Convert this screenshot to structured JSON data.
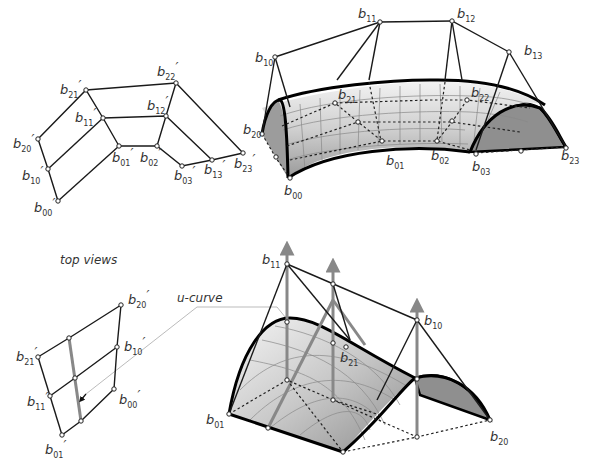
{
  "figure": {
    "caption_top_views": "top views",
    "caption_u_curve": "u-curve"
  },
  "top_left_view": {
    "labels": [
      {
        "base": "b",
        "sub": "21",
        "prime": "′"
      },
      {
        "base": "b",
        "sub": "22",
        "prime": "′"
      },
      {
        "base": "b",
        "sub": "11",
        "prime": "′"
      },
      {
        "base": "b",
        "sub": "12",
        "prime": "′"
      },
      {
        "base": "b",
        "sub": "20",
        "prime": "′"
      },
      {
        "base": "b",
        "sub": "10",
        "prime": "′"
      },
      {
        "base": "b",
        "sub": "00",
        "prime": "′"
      },
      {
        "base": "b",
        "sub": "01",
        "prime": "′"
      },
      {
        "base": "b",
        "sub": "02",
        "prime": "′"
      },
      {
        "base": "b",
        "sub": "03",
        "prime": "′"
      },
      {
        "base": "b",
        "sub": "13",
        "prime": "′"
      },
      {
        "base": "b",
        "sub": "23",
        "prime": "′"
      }
    ]
  },
  "top_right_surface": {
    "labels": [
      {
        "base": "b",
        "sub": "10"
      },
      {
        "base": "b",
        "sub": "11"
      },
      {
        "base": "b",
        "sub": "12"
      },
      {
        "base": "b",
        "sub": "13"
      },
      {
        "base": "b",
        "sub": "20"
      },
      {
        "base": "b",
        "sub": "21"
      },
      {
        "base": "b",
        "sub": "22"
      },
      {
        "base": "b",
        "sub": "00"
      },
      {
        "base": "b",
        "sub": "01"
      },
      {
        "base": "b",
        "sub": "02"
      },
      {
        "base": "b",
        "sub": "03"
      },
      {
        "base": "b",
        "sub": "23"
      }
    ]
  },
  "bottom_left_view": {
    "labels": [
      {
        "base": "b",
        "sub": "20",
        "prime": "′"
      },
      {
        "base": "b",
        "sub": "21",
        "prime": "′"
      },
      {
        "base": "b",
        "sub": "10",
        "prime": "′"
      },
      {
        "base": "b",
        "sub": "11",
        "prime": "′"
      },
      {
        "base": "b",
        "sub": "00",
        "prime": "′"
      },
      {
        "base": "b",
        "sub": "01",
        "prime": "′"
      }
    ]
  },
  "bottom_right_surface": {
    "labels": [
      {
        "base": "b",
        "sub": "11"
      },
      {
        "base": "b",
        "sub": "10"
      },
      {
        "base": "b",
        "sub": "21"
      },
      {
        "base": "b",
        "sub": "01"
      },
      {
        "base": "b",
        "sub": "20"
      }
    ]
  }
}
